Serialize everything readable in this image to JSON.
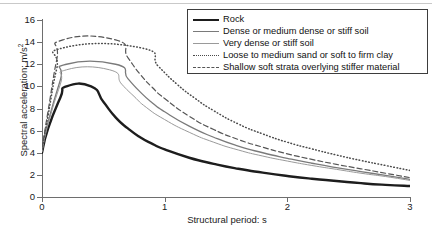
{
  "chart_data": {
    "type": "line",
    "title": "",
    "xlabel": "Structural period: s",
    "ylabel": "Spectral acceleration: m/s",
    "ylabel_sup": "2",
    "xlim": [
      0,
      3
    ],
    "ylim": [
      0,
      16
    ],
    "xticks": [
      "0",
      "1",
      "2",
      "3"
    ],
    "yticks": [
      "0",
      "2",
      "4",
      "6",
      "8",
      "10",
      "12",
      "14",
      "16"
    ],
    "grid": false,
    "legend_position": "top-right",
    "series": [
      {
        "name": "Rock",
        "style": "solid-thick",
        "color": "#1d1d1d",
        "x": [
          0.0,
          0.05,
          0.15,
          0.2,
          0.4,
          0.5,
          0.6,
          0.7,
          0.8,
          0.9,
          1.0,
          1.2,
          1.4,
          1.6,
          1.8,
          2.0,
          2.2,
          2.4,
          2.6,
          2.8,
          3.0
        ],
        "y": [
          4.0,
          6.2,
          9.0,
          10.0,
          10.0,
          8.6,
          7.2,
          6.2,
          5.4,
          4.8,
          4.3,
          3.55,
          3.0,
          2.55,
          2.2,
          1.9,
          1.65,
          1.45,
          1.25,
          1.1,
          1.0
        ]
      },
      {
        "name": "Dense or medium dense or stiff soil",
        "style": "solid-medium",
        "color": "#7a7a7a",
        "x": [
          0.0,
          0.05,
          0.15,
          0.2,
          0.6,
          0.7,
          0.8,
          0.9,
          1.0,
          1.2,
          1.4,
          1.6,
          1.8,
          2.0,
          2.2,
          2.4,
          2.6,
          2.8,
          3.0
        ],
        "y": [
          4.2,
          6.8,
          10.6,
          12.0,
          12.0,
          10.7,
          9.5,
          8.5,
          7.7,
          6.4,
          5.4,
          4.6,
          4.0,
          3.5,
          3.05,
          2.65,
          2.3,
          1.95,
          1.6
        ]
      },
      {
        "name": "Very dense or stiff soil",
        "style": "solid-thin",
        "color": "#9a9a9a",
        "x": [
          0.0,
          0.05,
          0.15,
          0.2,
          0.55,
          0.65,
          0.75,
          0.85,
          1.0,
          1.2,
          1.4,
          1.6,
          1.8,
          2.0,
          2.2,
          2.4,
          2.6,
          2.8,
          3.0
        ],
        "y": [
          4.1,
          6.6,
          10.2,
          11.5,
          11.5,
          10.2,
          9.1,
          8.1,
          7.0,
          5.85,
          4.95,
          4.25,
          3.7,
          3.25,
          2.85,
          2.5,
          2.15,
          1.85,
          1.5
        ]
      },
      {
        "name": "Loose to medium sand or soft to firm clay",
        "style": "dotted",
        "color": "#4a4a4a",
        "x": [
          0.0,
          0.05,
          0.12,
          0.18,
          0.8,
          0.95,
          1.1,
          1.25,
          1.4,
          1.6,
          1.8,
          2.0,
          2.2,
          2.4,
          2.6,
          2.8,
          3.0
        ],
        "y": [
          4.3,
          7.4,
          11.6,
          13.5,
          13.5,
          11.8,
          10.2,
          8.9,
          7.8,
          6.6,
          5.7,
          4.95,
          4.35,
          3.8,
          3.3,
          2.85,
          2.4
        ]
      },
      {
        "name": "Shallow soft strata overlying stiffer material",
        "style": "dashed",
        "color": "#555555",
        "x": [
          0.0,
          0.05,
          0.12,
          0.17,
          0.6,
          0.7,
          0.8,
          0.9,
          1.0,
          1.2,
          1.4,
          1.6,
          1.8,
          2.0,
          2.2,
          2.4,
          2.6,
          2.8,
          3.0
        ],
        "y": [
          4.4,
          7.8,
          12.4,
          14.2,
          14.2,
          12.6,
          11.1,
          9.9,
          8.9,
          7.3,
          6.1,
          5.2,
          4.5,
          3.9,
          3.4,
          2.95,
          2.55,
          2.15,
          1.75
        ]
      }
    ]
  },
  "legend": {
    "items": [
      {
        "label": "Rock"
      },
      {
        "label": "Dense or medium dense or stiff soil"
      },
      {
        "label": "Very dense or stiff soil"
      },
      {
        "label": "Loose to medium sand or soft to firm clay"
      },
      {
        "label": "Shallow soft strata overlying stiffer material"
      }
    ]
  }
}
